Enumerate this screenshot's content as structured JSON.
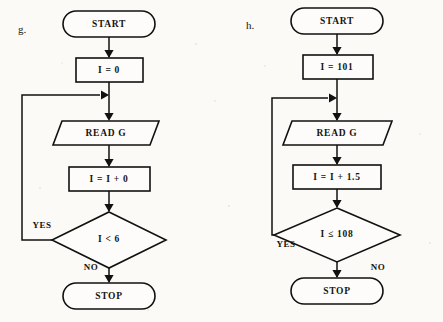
{
  "page": {
    "background_color": "#fbfaf7",
    "ink_color": "#111111"
  },
  "charts": [
    {
      "tag": "g.",
      "tag_x": 22,
      "tag_y": 30,
      "center_x": 109,
      "nodes": {
        "start": "START",
        "init": "I = 0",
        "read": "READ G",
        "increment": "I = I + 0",
        "decision": "I < 6",
        "stop": "STOP"
      },
      "branches": {
        "yes": "YES",
        "no": "NO"
      },
      "yes_label_x": 42,
      "yes_label_y": 226,
      "no_label_x": 91,
      "no_label_y": 268
    },
    {
      "tag": "h.",
      "tag_x": 250,
      "tag_y": 26,
      "center_x": 337,
      "nodes": {
        "start": "START",
        "init": "I = 101",
        "read": "READ G",
        "increment": "I = I + 1.5",
        "decision": "I ≤ 108",
        "stop": "STOP"
      },
      "branches": {
        "yes": "YES",
        "no": "NO"
      },
      "yes_label_x": 286,
      "yes_label_y": 245,
      "no_label_x": 378,
      "no_label_y": 268
    }
  ]
}
